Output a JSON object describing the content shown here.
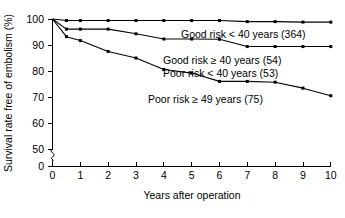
{
  "chart_data": {
    "type": "line",
    "title": "",
    "xlabel": "Years after operation",
    "ylabel": "Survival rate free of embolism (%)",
    "xlim": [
      0,
      10
    ],
    "ylim": [
      50,
      100
    ],
    "y_axis_break": true,
    "y_axis_break_from": 0,
    "y_axis_break_to": 50,
    "grid": false,
    "legend_position": "inline-annotations",
    "xticks": [
      "0",
      "1",
      "2",
      "3",
      "4",
      "5",
      "6",
      "7",
      "8",
      "9",
      "10"
    ],
    "yticks": [
      "0",
      "50",
      "60",
      "70",
      "80",
      "90",
      "100"
    ],
    "series": [
      {
        "name": "Good risk < 40 years (364)",
        "label": "Good risk < 40 years (364)",
        "count": 364,
        "x": [
          0,
          0.5,
          1,
          2,
          3,
          4,
          5,
          6,
          7,
          8,
          9,
          10
        ],
        "values": [
          100,
          99.4,
          99.4,
          99.4,
          99.4,
          99.4,
          99.4,
          99.4,
          99.0,
          99.0,
          98.8,
          98.8
        ]
      },
      {
        "name": "Good risk >= 40 years (54) / Poor risk < 40 years (53)",
        "label": "Good risk ≥ 40 years (54)",
        "label2": "Poor risk < 40 years (53)",
        "count": 54,
        "count2": 53,
        "x": [
          0,
          0.5,
          1,
          2,
          3,
          4,
          5,
          6,
          7,
          8,
          9,
          10
        ],
        "values": [
          100,
          96.1,
          96.1,
          96.1,
          94.3,
          92.3,
          92.3,
          92.2,
          89.4,
          89.4,
          89.4,
          89.4
        ]
      },
      {
        "name": "Poor risk >= 49 years (75)",
        "label": "Poor risk ≥ 49 years (75)",
        "count": 75,
        "x": [
          0,
          0.5,
          1,
          2,
          3,
          4,
          5,
          6,
          7,
          8,
          9,
          10
        ],
        "values": [
          100,
          93.2,
          91.7,
          87.5,
          85.0,
          80.6,
          79.2,
          76.0,
          76.0,
          75.7,
          73.4,
          70.5
        ]
      }
    ],
    "annotations": [
      {
        "text": "Good risk < 40 years (364)",
        "x_px": 181,
        "y_px": 38
      },
      {
        "text": "Good risk ≥ 40 years (54)",
        "x_px": 163,
        "y_px": 64
      },
      {
        "text": "Poor risk < 40 years (53)",
        "x_px": 163,
        "y_px": 77
      },
      {
        "text": "Poor risk ≥ 49 years (75)",
        "x_px": 148,
        "y_px": 103
      }
    ]
  }
}
